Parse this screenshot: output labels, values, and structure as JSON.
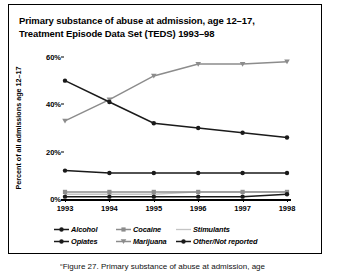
{
  "figure": {
    "title_line1": "Primary substance of abuse at admission, age 12–17,",
    "title_line2": "Treatment Episode Data Set (TEDS) 1993–98",
    "caption": "“Figure 27. Primary substance of abuse at admission, age"
  },
  "colors": {
    "dark": "#1a1a1a",
    "alcohol": "#1a1a1a",
    "cocaine": "#8c8c8c",
    "stimulants": "#c4c4c4",
    "opiates": "#1a1a1a",
    "marijuana": "#8c8c8c",
    "other": "#1a1a1a",
    "axis": "#000000",
    "background": "#ffffff",
    "border": "#000000"
  },
  "chart_data": {
    "type": "line",
    "title": "Primary substance of abuse at admission, age 12–17, Treatment Episode Data Set (TEDS) 1993–98",
    "xlabel": "",
    "ylabel": "Percent of all admissions age 12–17",
    "categories": [
      "1993",
      "1994",
      "1995",
      "1996",
      "1997",
      "1998"
    ],
    "x": [
      1993,
      1994,
      1995,
      1996,
      1997,
      1998
    ],
    "ylim": [
      0,
      60
    ],
    "yticks": [
      0,
      20,
      40,
      60
    ],
    "ytick_labels": [
      "0%",
      "20%",
      "40%",
      "60%"
    ],
    "grid": false,
    "legend_position": "bottom",
    "series": [
      {
        "name": "Alcohol",
        "color": "#1a1a1a",
        "marker": "circle",
        "values": [
          50,
          41,
          32,
          30,
          28,
          26
        ]
      },
      {
        "name": "Cocaine",
        "color": "#8c8c8c",
        "marker": "square",
        "values": [
          3,
          3,
          3,
          3,
          3,
          3
        ]
      },
      {
        "name": "Stimulants",
        "color": "#c4c4c4",
        "marker": "none",
        "values": [
          2,
          2,
          2,
          3,
          3,
          3
        ]
      },
      {
        "name": "Opiates",
        "color": "#1a1a1a",
        "marker": "circle",
        "values": [
          1,
          1,
          1,
          1,
          1,
          2
        ]
      },
      {
        "name": "Marijuana",
        "color": "#8c8c8c",
        "marker": "triangle-down",
        "values": [
          33,
          42,
          52,
          57,
          57,
          58
        ]
      },
      {
        "name": "Other/Not reported",
        "color": "#1a1a1a",
        "marker": "circle",
        "values": [
          12,
          11,
          11,
          11,
          11,
          11
        ]
      }
    ]
  },
  "legend": {
    "rows": [
      [
        {
          "label": "Alcohol",
          "series": 0
        },
        {
          "label": "Cocaine",
          "series": 1
        },
        {
          "label": "Stimulants",
          "series": 2
        }
      ],
      [
        {
          "label": "Opiates",
          "series": 3
        },
        {
          "label": "Marijuana",
          "series": 4
        },
        {
          "label": "Other/Not reported",
          "series": 5
        }
      ]
    ]
  }
}
